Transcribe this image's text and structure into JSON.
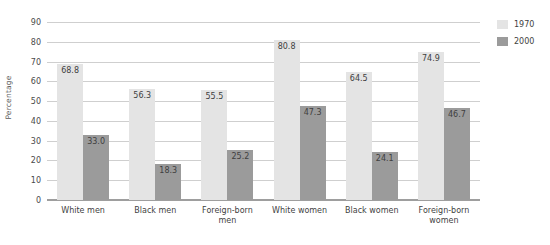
{
  "chart_data": {
    "type": "bar",
    "title": "",
    "xlabel": "",
    "ylabel": "Percentage",
    "ylim": [
      0,
      90
    ],
    "yticks": [
      0,
      10,
      20,
      30,
      40,
      50,
      60,
      70,
      80,
      90
    ],
    "grid": true,
    "legend_position": "top-right",
    "categories": [
      "White men",
      "Black men",
      "Foreign-born men",
      "White women",
      "Black women",
      "Foreign-born women"
    ],
    "category_lines": [
      [
        "White men"
      ],
      [
        "Black men"
      ],
      [
        "Foreign-born",
        "men"
      ],
      [
        "White women"
      ],
      [
        "Black women"
      ],
      [
        "Foreign-born",
        "women"
      ]
    ],
    "series": [
      {
        "name": "1970",
        "color": "#e4e4e4",
        "values": [
          68.8,
          56.3,
          55.5,
          80.8,
          64.5,
          74.9
        ],
        "labels": [
          "68.8",
          "56.3",
          "55.5",
          "80.8",
          "64.5",
          "74.9"
        ]
      },
      {
        "name": "2000",
        "color": "#9b9b9b",
        "values": [
          33.0,
          18.3,
          25.2,
          47.3,
          24.1,
          46.7
        ],
        "labels": [
          "33.0",
          "18.3",
          "25.2",
          "47.3",
          "24.1",
          "46.7"
        ]
      }
    ]
  },
  "legend": {
    "items": [
      {
        "label": "1970",
        "color": "#e4e4e4"
      },
      {
        "label": "2000",
        "color": "#9b9b9b"
      }
    ]
  },
  "axis": {
    "y_title": "Percentage",
    "y_tick_labels": [
      "90",
      "80",
      "70",
      "60",
      "50",
      "40",
      "30",
      "20",
      "10",
      "0"
    ]
  }
}
